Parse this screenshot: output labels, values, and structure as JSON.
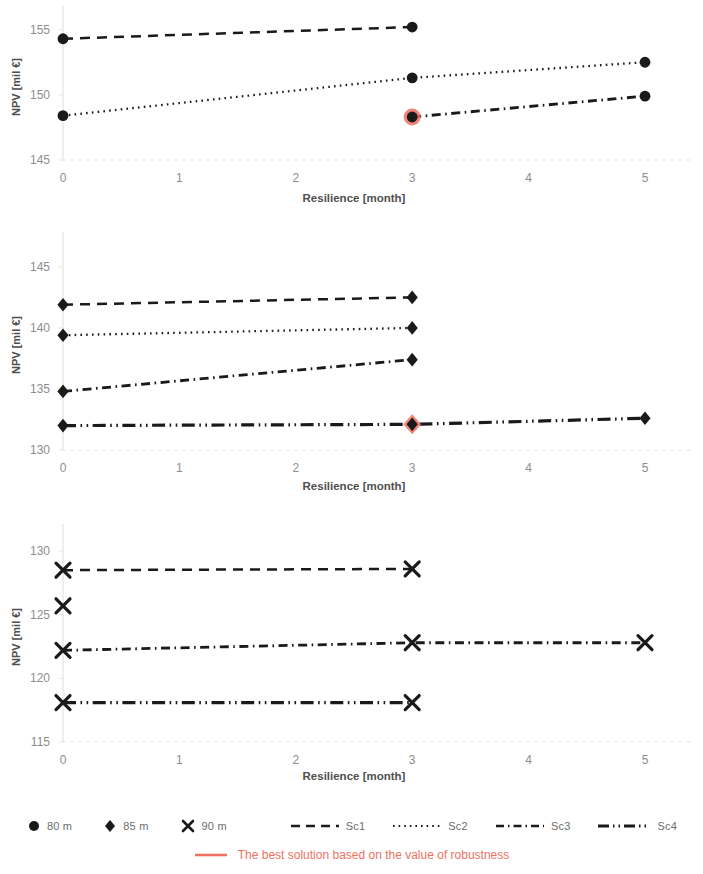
{
  "chart_data": [
    {
      "type": "line",
      "title": "",
      "subtitle": "80 m",
      "xlabel": "Resilience [month]",
      "ylabel": "NPV [mil €]",
      "xlim": [
        0,
        5
      ],
      "ylim": [
        145,
        156.2
      ],
      "xticks": [
        0,
        1,
        2,
        3,
        4,
        5
      ],
      "yticks": [
        145,
        150,
        155
      ],
      "marker": "circle",
      "grid": false,
      "legend_position": "below-figure",
      "series": [
        {
          "name": "Sc1",
          "style": "dashed",
          "x": [
            0,
            3
          ],
          "values": [
            154.3,
            155.2
          ]
        },
        {
          "name": "Sc2",
          "style": "dotted",
          "x": [
            0,
            3,
            5
          ],
          "values": [
            148.4,
            151.3,
            152.5
          ]
        },
        {
          "name": "Sc3",
          "style": "dash-dot",
          "x": [
            3,
            5
          ],
          "values": [
            148.3,
            149.9
          ]
        },
        {
          "name": "Sc4",
          "style": "dash-dot-dot",
          "x": [],
          "values": []
        }
      ],
      "highlight": {
        "x": 3,
        "value": 148.3,
        "series": "Sc3",
        "color": "#ED7263"
      }
    },
    {
      "type": "line",
      "title": "",
      "subtitle": "85 m",
      "xlabel": "Resilience [month]",
      "ylabel": "NPV [mil €]",
      "xlim": [
        0,
        5
      ],
      "ylim": [
        130,
        147.2
      ],
      "xticks": [
        0,
        1,
        2,
        3,
        4,
        5
      ],
      "yticks": [
        130,
        135,
        140,
        145
      ],
      "marker": "diamond",
      "grid": false,
      "legend_position": "below-figure",
      "series": [
        {
          "name": "Sc1",
          "style": "dashed",
          "x": [
            0,
            3
          ],
          "values": [
            141.9,
            142.5
          ]
        },
        {
          "name": "Sc2",
          "style": "dotted",
          "x": [
            0,
            3
          ],
          "values": [
            139.4,
            140.0
          ]
        },
        {
          "name": "Sc3",
          "style": "dash-dot",
          "x": [
            0,
            3
          ],
          "values": [
            134.8,
            137.4
          ]
        },
        {
          "name": "Sc4",
          "style": "dash-dot-dot",
          "x": [
            0,
            3,
            5
          ],
          "values": [
            132.0,
            132.1,
            132.6
          ]
        }
      ],
      "highlight": {
        "x": 3,
        "value": 132.1,
        "series": "Sc4",
        "color": "#ED7263"
      }
    },
    {
      "type": "line",
      "title": "",
      "subtitle": "90 m",
      "xlabel": "Resilience [month]",
      "ylabel": "NPV [mil €]",
      "xlim": [
        0,
        5
      ],
      "ylim": [
        115,
        131.5
      ],
      "xticks": [
        0,
        1,
        2,
        3,
        4,
        5
      ],
      "yticks": [
        115,
        120,
        125,
        130
      ],
      "marker": "x",
      "grid": false,
      "legend_position": "below-figure",
      "series": [
        {
          "name": "Sc1",
          "style": "dashed",
          "x": [
            0,
            3
          ],
          "values": [
            128.5,
            128.6
          ]
        },
        {
          "name": "Sc2",
          "style": "dotted",
          "x": [
            0
          ],
          "values": [
            125.7
          ]
        },
        {
          "name": "Sc3",
          "style": "dash-dot",
          "x": [
            0,
            3,
            5
          ],
          "values": [
            122.2,
            122.8,
            122.8
          ]
        },
        {
          "name": "Sc4",
          "style": "dash-dot-dot",
          "x": [
            0,
            3
          ],
          "values": [
            118.1,
            118.1
          ]
        }
      ],
      "highlight": null
    }
  ],
  "legend": {
    "markers": [
      {
        "symbol": "circle",
        "label": "80 m"
      },
      {
        "symbol": "diamond",
        "label": "85 m"
      },
      {
        "symbol": "x",
        "label": "90 m"
      }
    ],
    "lines": [
      {
        "style": "dashed",
        "label": "Sc1"
      },
      {
        "style": "dotted",
        "label": "Sc2"
      },
      {
        "style": "dash-dot",
        "label": "Sc3"
      },
      {
        "style": "dash-dot-dot",
        "label": "Sc4"
      }
    ],
    "note": {
      "label": "The best solution based on the value of robustness",
      "color": "#ED7263"
    }
  },
  "axes": {
    "xlabel": "Resilience [month]",
    "ylabel": "NPV [mil €]"
  },
  "colors": {
    "line": "#1a1a1a",
    "tick_text": "#8d8d8d",
    "axis_label": "#4f4f4f",
    "axis_line": "#e2e2e2",
    "highlight": "#ED7263"
  }
}
